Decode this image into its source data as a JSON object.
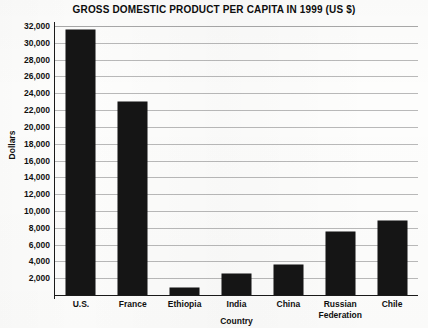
{
  "chart_data": {
    "type": "bar",
    "title": "GROSS DOMESTIC PRODUCT PER CAPITA IN 1999 (US $)",
    "xlabel": "Country",
    "ylabel": "Dollars",
    "categories": [
      "U.S.",
      "France",
      "Ethiopia",
      "India",
      "China",
      "Russian Federation",
      "Chile"
    ],
    "values": [
      31500,
      23000,
      800,
      2450,
      3550,
      7550,
      8800
    ],
    "ylim": [
      0,
      32000
    ],
    "yticks": [
      2000,
      4000,
      6000,
      8000,
      10000,
      12000,
      14000,
      16000,
      18000,
      20000,
      22000,
      24000,
      26000,
      28000,
      30000,
      32000
    ],
    "ytick_labels": [
      "2,000",
      "4,000",
      "6,000",
      "8,000",
      "10,000",
      "12,000",
      "14,000",
      "16,000",
      "18,000",
      "20,000",
      "22,000",
      "24,000",
      "26,000",
      "28,000",
      "30,000",
      "32,000"
    ],
    "xtick_labels": [
      [
        "U.S."
      ],
      [
        "France"
      ],
      [
        "Ethiopia"
      ],
      [
        "India"
      ],
      [
        "China"
      ],
      [
        "Russian",
        "Federation"
      ],
      [
        "Chile"
      ]
    ],
    "grid": "horizontal",
    "legend": "none",
    "bar_color": "#151515",
    "grid_color": "#b9b9b9",
    "axis_color": "#1a1a1a"
  }
}
